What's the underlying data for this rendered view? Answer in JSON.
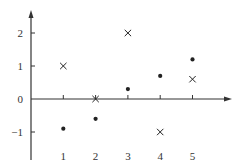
{
  "chart_data": {
    "type": "scatter",
    "title": "",
    "xlabel": "",
    "ylabel": "",
    "xlim": [
      0,
      6
    ],
    "ylim": [
      -1.5,
      2.6
    ],
    "x_ticks": [
      1,
      2,
      3,
      4,
      5
    ],
    "y_ticks": [
      2,
      1,
      0,
      -1
    ],
    "x_tick_labels": [
      "1",
      "2",
      "3",
      "4",
      "5"
    ],
    "y_tick_labels": [
      "2",
      "1",
      "0",
      "−1"
    ],
    "grid": false,
    "legend": null,
    "series": [
      {
        "name": "cross",
        "marker": "x",
        "x": [
          1,
          2,
          3,
          4,
          5
        ],
        "y": [
          1,
          0,
          2,
          -1,
          0.6
        ]
      },
      {
        "name": "dot",
        "marker": "o",
        "x": [
          1,
          2,
          3,
          4,
          5
        ],
        "y": [
          -0.9,
          -0.6,
          0.3,
          0.7,
          1.2
        ]
      }
    ],
    "colors": {
      "axis": "#333333",
      "marker": "#222222"
    }
  }
}
